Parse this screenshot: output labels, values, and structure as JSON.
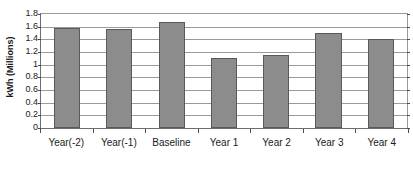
{
  "chart_data": {
    "type": "bar",
    "title": "",
    "xlabel": "",
    "ylabel": "kWh (Millions)",
    "categories": [
      "Year(-2)",
      "Year(-1)",
      "Baseline",
      "Year 1",
      "Year 2",
      "Year 3",
      "Year 4"
    ],
    "values": [
      1.58,
      1.57,
      1.67,
      1.11,
      1.16,
      1.5,
      1.4
    ],
    "series": [
      {
        "name": "kWh (Millions)",
        "values": [
          1.58,
          1.57,
          1.67,
          1.11,
          1.16,
          1.5,
          1.4
        ]
      }
    ],
    "ylim": [
      0,
      1.8
    ],
    "ytick_labels": [
      "1.8",
      "1.6",
      "1.4",
      "1.2",
      "1",
      "0.8",
      "0.6",
      "0.4",
      "0.2",
      "0"
    ],
    "ytick_values": [
      1.8,
      1.6,
      1.4,
      1.2,
      1.0,
      0.8,
      0.6,
      0.4,
      0.2,
      0
    ],
    "grid": true,
    "grid_axis": "y",
    "legend": false,
    "legend_position": "none",
    "bar_color": "#8c8c8c",
    "bar_border_color": "#5a5a5a",
    "grid_color": "#9a9a9a",
    "axis_color": "#6e6e6e",
    "text_color": "#1a1a1a",
    "background": "#ffffff"
  }
}
